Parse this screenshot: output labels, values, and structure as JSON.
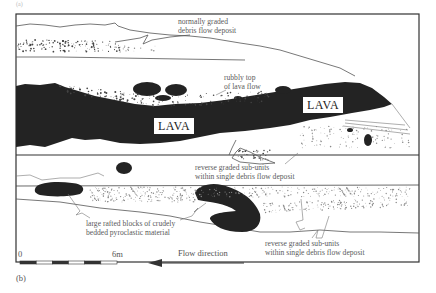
{
  "figure": {
    "panel_label": "(b)",
    "lava_labels": [
      "LAVA",
      "LAVA"
    ],
    "annotations": {
      "normally_graded": [
        "normally graded",
        "debris flow deposit"
      ],
      "rubbly_top": [
        "rubbly top",
        "of lava flow"
      ],
      "reverse_graded_upper": [
        "reverse graded sub-units",
        "within single debris flow deposit"
      ],
      "rafted_blocks": [
        "large rafted blocks of crudely",
        "bedded pyroclastic material"
      ],
      "reverse_graded_lower": [
        "reverse graded sub-units",
        "within single debris flow deposit"
      ]
    },
    "scale_bar": {
      "start_label": "0",
      "end_label": "6m",
      "segments": 6
    },
    "flow_direction": {
      "label": "Flow direction",
      "arrow": "left-arrow-icon"
    },
    "colors": {
      "lava_fill": "#232323",
      "line": "#555555",
      "background": "#ffffff"
    }
  }
}
